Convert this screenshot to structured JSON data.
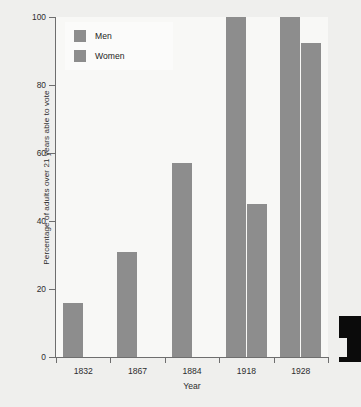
{
  "chart_data": {
    "type": "bar",
    "title": "",
    "xlabel": "Year",
    "ylabel": "Percentage of adults over 21 years able to vote",
    "categories": [
      "1832",
      "1867",
      "1884",
      "1918",
      "1928"
    ],
    "series": [
      {
        "name": "Men",
        "values": [
          16,
          31,
          57,
          100,
          100
        ]
      },
      {
        "name": "Women",
        "values": [
          0,
          0,
          0,
          45,
          92.5
        ]
      }
    ],
    "ylim": [
      0,
      100
    ],
    "yticks": [
      0,
      20,
      40,
      60,
      80,
      100
    ],
    "ytick_labels": [
      "0",
      "20",
      "40",
      "60",
      "80",
      "100"
    ],
    "grid": false,
    "legend_position": "upper left",
    "legend_entries": [
      "Men",
      "Women"
    ],
    "colors": {
      "men_bar": "#8d8d8d",
      "women_bar": "#8d8d8d",
      "plot_background": "#f8f8f6",
      "figure_background": "#efefed",
      "axis": "#6e6e6e",
      "text": "#2d2d2d"
    }
  }
}
